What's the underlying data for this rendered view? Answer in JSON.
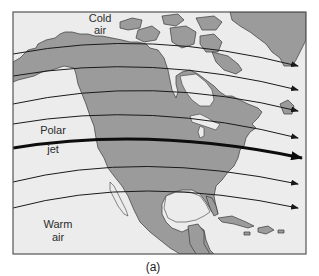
{
  "figure": {
    "caption": "(a)",
    "labels": {
      "cold_line1": "Cold",
      "cold_line2": "air",
      "polar_line1": "Polar",
      "polar_line2": "jet",
      "warm_line1": "Warm",
      "warm_line2": "air"
    },
    "colors": {
      "ocean": "#ececec",
      "land": "#9b9b9b",
      "land_stroke": "#3a3a3a",
      "frame": "#555555",
      "flow_line": "#1a1a1a",
      "jet": "#0d0d0d"
    },
    "flow_lines": [
      {
        "name": "flow-line-1",
        "end_y": 65
      },
      {
        "name": "flow-line-2",
        "end_y": 89
      },
      {
        "name": "flow-line-3",
        "end_y": 111
      },
      {
        "name": "flow-line-4",
        "end_y": 138
      },
      {
        "name": "polar-jet",
        "end_y": 158,
        "thick": true
      },
      {
        "name": "flow-line-6",
        "end_y": 183
      },
      {
        "name": "flow-line-7",
        "end_y": 208
      }
    ]
  }
}
